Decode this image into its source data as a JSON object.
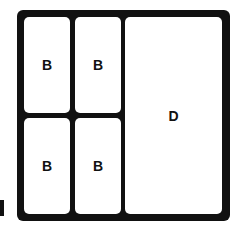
{
  "diagram": {
    "cells": [
      {
        "label": "B",
        "position": "top-left"
      },
      {
        "label": "B",
        "position": "top-middle"
      },
      {
        "label": "B",
        "position": "bottom-left"
      },
      {
        "label": "B",
        "position": "bottom-middle"
      },
      {
        "label": "D",
        "position": "right-full-height"
      }
    ],
    "colors": {
      "border": "#111111",
      "fill": "#ffffff"
    }
  }
}
